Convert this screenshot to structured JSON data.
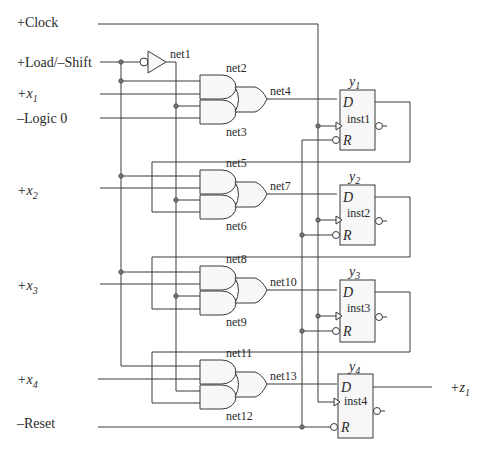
{
  "inputs": {
    "clock": "+Clock",
    "load_shift": "+Load/–Shift",
    "x1": "+x",
    "x1_sub": "1",
    "logic0": "–Logic 0",
    "x2": "+x",
    "x2_sub": "2",
    "x3": "+x",
    "x3_sub": "3",
    "x4": "+x",
    "x4_sub": "4",
    "reset": "–Reset"
  },
  "output": {
    "label": "+z",
    "sub": "1"
  },
  "nets": {
    "n1": "net1",
    "n2": "net2",
    "n3": "net3",
    "n4": "net4",
    "n5": "net5",
    "n6": "net6",
    "n7": "net7",
    "n8": "net8",
    "n9": "net9",
    "n10": "net10",
    "n11": "net11",
    "n12": "net12",
    "n13": "net13"
  },
  "flipflops": [
    {
      "name": "y",
      "sub": "1",
      "inst": "inst1",
      "d": "D",
      "r": "R"
    },
    {
      "name": "y",
      "sub": "2",
      "inst": "inst2",
      "d": "D",
      "r": "R"
    },
    {
      "name": "y",
      "sub": "3",
      "inst": "inst3",
      "d": "D",
      "r": "R"
    },
    {
      "name": "y",
      "sub": "4",
      "inst": "inst4",
      "d": "D",
      "r": "R"
    }
  ]
}
